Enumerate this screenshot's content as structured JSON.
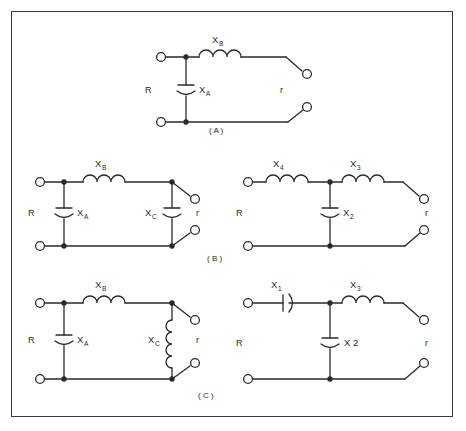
{
  "figure": {
    "border_color": "#3a3a3a",
    "line_color": "#2a2a2a",
    "background": "#ffffff",
    "group_labels": [
      {
        "name": "group-label-a",
        "text": "( A )",
        "x": 218,
        "y": 131
      },
      {
        "name": "group-label-b",
        "text": "( B )",
        "x": 216,
        "y": 259
      },
      {
        "name": "group-label-c",
        "text": "( C )",
        "x": 206,
        "y": 396
      }
    ]
  },
  "circuits": [
    {
      "id": "circuit-a",
      "group": "A",
      "position": "top-center",
      "description": "L-section low-pass: shunt capacitor X_A at input, series inductor X_B",
      "input_label": "R",
      "output_label": "r",
      "components": [
        {
          "name": "series-inductor-xb",
          "type": "inductor",
          "orientation": "horizontal",
          "label": "X",
          "subscript": "B",
          "coils": 3
        },
        {
          "name": "shunt-capacitor-xa",
          "type": "capacitor",
          "orientation": "vertical",
          "label": "X",
          "subscript": "A"
        }
      ]
    },
    {
      "id": "circuit-b-left",
      "group": "B",
      "position": "middle-left",
      "description": "Pi-section: shunt capacitor X_A, series inductor X_B, shunt capacitor X_C",
      "input_label": "R",
      "output_label": "r",
      "components": [
        {
          "name": "series-inductor-xb",
          "type": "inductor",
          "orientation": "horizontal",
          "label": "X",
          "subscript": "B",
          "coils": 3
        },
        {
          "name": "shunt-capacitor-xa",
          "type": "capacitor",
          "orientation": "vertical",
          "label": "X",
          "subscript": "A"
        },
        {
          "name": "shunt-capacitor-xc",
          "type": "capacitor",
          "orientation": "vertical",
          "label": "X",
          "subscript": "C"
        }
      ]
    },
    {
      "id": "circuit-b-right",
      "group": "B",
      "position": "middle-right",
      "description": "T-section: series inductors X4 and X3 with shunt capacitor X2",
      "input_label": "R",
      "output_label": "r",
      "components": [
        {
          "name": "series-inductor-x4",
          "type": "inductor",
          "orientation": "horizontal",
          "label": "X",
          "subscript": "4",
          "coils": 3
        },
        {
          "name": "series-inductor-x3",
          "type": "inductor",
          "orientation": "horizontal",
          "label": "X",
          "subscript": "3",
          "coils": 3
        },
        {
          "name": "shunt-capacitor-x2",
          "type": "capacitor",
          "orientation": "vertical",
          "label": "X",
          "subscript": "2"
        }
      ]
    },
    {
      "id": "circuit-c-left",
      "group": "C",
      "position": "bottom-left",
      "description": "Shunt capacitor X_A, series inductor X_B, shunt inductor X_C",
      "input_label": "R",
      "output_label": "r",
      "components": [
        {
          "name": "series-inductor-xb",
          "type": "inductor",
          "orientation": "horizontal",
          "label": "X",
          "subscript": "B",
          "coils": 3
        },
        {
          "name": "shunt-capacitor-xa",
          "type": "capacitor",
          "orientation": "vertical",
          "label": "X",
          "subscript": "A"
        },
        {
          "name": "shunt-inductor-xc",
          "type": "inductor",
          "orientation": "vertical",
          "label": "X",
          "subscript": "C",
          "coils": 4
        }
      ]
    },
    {
      "id": "circuit-c-right",
      "group": "C",
      "position": "bottom-right",
      "description": "Series capacitor X1, shunt capacitor X2, series inductor X3",
      "input_label": "R",
      "output_label": "r",
      "components": [
        {
          "name": "series-capacitor-x1",
          "type": "capacitor",
          "orientation": "horizontal",
          "label": "X",
          "subscript": "1"
        },
        {
          "name": "series-inductor-x3",
          "type": "inductor",
          "orientation": "horizontal",
          "label": "X",
          "subscript": "3",
          "coils": 3
        },
        {
          "name": "shunt-capacitor-x2",
          "type": "capacitor",
          "orientation": "vertical",
          "label": "X 2",
          "subscript": ""
        }
      ]
    }
  ],
  "labels": {
    "a": {
      "xb": "X",
      "xb_sub": "B",
      "xa": "X",
      "xa_sub": "A",
      "r_in": "R",
      "r_out": "r"
    },
    "b_left": {
      "xb": "X",
      "xb_sub": "B",
      "xa": "X",
      "xa_sub": "A",
      "xc": "X",
      "xc_sub": "C",
      "r_in": "R",
      "r_out": "r"
    },
    "b_right": {
      "x4": "X",
      "x4_sub": "4",
      "x3": "X",
      "x3_sub": "3",
      "x2": "X",
      "x2_sub": "2",
      "r_in": "R",
      "r_out": "r"
    },
    "c_left": {
      "xb": "X",
      "xb_sub": "B",
      "xa": "X",
      "xa_sub": "A",
      "xc": "X",
      "xc_sub": "C",
      "r_in": "R",
      "r_out": "r"
    },
    "c_right": {
      "x1": "X",
      "x1_sub": "1",
      "x3": "X",
      "x3_sub": "3",
      "x2": "X 2",
      "r_in": "R",
      "r_out": "r"
    }
  }
}
